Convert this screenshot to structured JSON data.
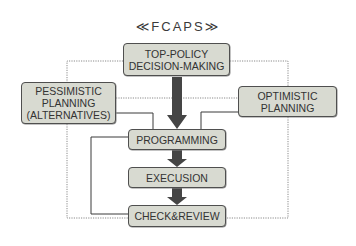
{
  "diagram": {
    "title": "≪FCAPS≫",
    "nodes": {
      "top_policy": {
        "label": "TOP-POLICY\nDECISION-MAKING"
      },
      "pessimistic": {
        "label": "PESSIMISTIC\nPLANNING\n(ALTERNATIVES)"
      },
      "optimistic": {
        "label": "OPTIMISTIC\nPLANNING"
      },
      "programming": {
        "label": "PROGRAMMING"
      },
      "execusion": {
        "label": "EXECUSION"
      },
      "check_review": {
        "label": "CHECK&REVIEW"
      }
    },
    "edges": [
      {
        "from": "top_policy",
        "to": "programming",
        "style": "thick-arrow"
      },
      {
        "from": "programming",
        "to": "execusion",
        "style": "thick-arrow"
      },
      {
        "from": "execusion",
        "to": "check_review",
        "style": "thick-arrow"
      },
      {
        "from": "top_policy",
        "to": "pessimistic",
        "style": "dotted"
      },
      {
        "from": "top_policy",
        "to": "optimistic",
        "style": "dotted"
      },
      {
        "from": "pessimistic",
        "to": "optimistic",
        "style": "dotted"
      },
      {
        "from": "pessimistic",
        "to": "programming",
        "style": "solid"
      },
      {
        "from": "optimistic",
        "to": "programming",
        "style": "solid"
      },
      {
        "from": "programming",
        "to": "check_review",
        "style": "solid"
      },
      {
        "from": "pessimistic",
        "to": "check_review",
        "style": "dotted"
      },
      {
        "from": "optimistic",
        "to": "check_review",
        "style": "dotted"
      }
    ],
    "colors": {
      "box_fill": "#d8dad1",
      "box_border": "#4f4f4f",
      "arrow": "#454545",
      "solid_line": "#3a3a3a",
      "dotted_line": "#8a8a8a",
      "text": "#333333"
    }
  }
}
